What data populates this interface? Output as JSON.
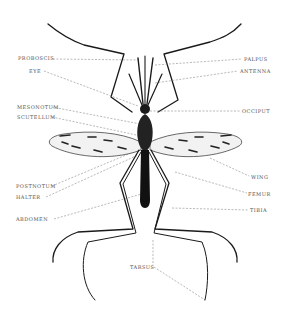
{
  "diagram": {
    "labels": {
      "proboscis": "PROBOSCIS",
      "eye": "EYE",
      "mesonotum": "MESONOTUM",
      "scutellum": "SCUTELLUM",
      "postnotum": "POSTNOTUM",
      "halter": "HALTER",
      "abdomen": "ABDOMEN",
      "palpus": "PALPUS",
      "antenna": "ANTENNA",
      "occiput": "OCCIPUT",
      "wing": "WING",
      "femur": "FEMUR",
      "tibia": "TIBIA",
      "tarsus": "TARSUS"
    },
    "colors": {
      "ink": "#1a1a1a",
      "leader": "#8a8a8a",
      "label": "#555555",
      "background": "#ffffff"
    }
  }
}
